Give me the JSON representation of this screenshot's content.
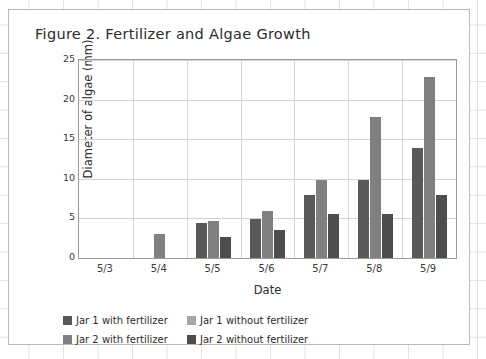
{
  "chart_data": {
    "type": "bar",
    "title": "Figure 2. Fertilizer and Algae Growth",
    "xlabel": "Date",
    "ylabel": "Diameter of algae (mm)",
    "categories": [
      "5/3",
      "5/4",
      "5/5",
      "5/6",
      "5/7",
      "5/8",
      "5/9"
    ],
    "ylim": [
      0,
      25
    ],
    "yticks": [
      0,
      5,
      10,
      15,
      20,
      25
    ],
    "grid": true,
    "legend_position": "bottom",
    "series": [
      {
        "name": "Jar 1 with fertilizer",
        "color": "#595959",
        "values": [
          0,
          0,
          4.4,
          4.9,
          7.9,
          9.9,
          13.9
        ]
      },
      {
        "name": "Jar 1 without fertilizer",
        "color": "#a6a6a6",
        "values": [
          0,
          0,
          0,
          0,
          0,
          0,
          0
        ]
      },
      {
        "name": "Jar 2 with fertilizer",
        "color": "#808080",
        "values": [
          0,
          3.0,
          4.7,
          5.9,
          9.8,
          17.8,
          22.8
        ]
      },
      {
        "name": "Jar 2 without fertilizer",
        "color": "#4d4d4d",
        "values": [
          0,
          0,
          2.7,
          3.6,
          5.6,
          5.6,
          7.9
        ]
      }
    ]
  },
  "legend": {
    "items": [
      {
        "label": "Jar 1 with fertilizer",
        "color": "#595959"
      },
      {
        "label": "Jar 1 without fertilizer",
        "color": "#a6a6a6"
      },
      {
        "label": "Jar 2 with fertilizer",
        "color": "#808080"
      },
      {
        "label": "Jar 2 without fertilizer",
        "color": "#4d4d4d"
      }
    ]
  }
}
